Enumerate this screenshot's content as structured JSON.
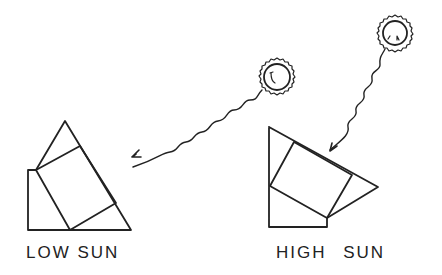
{
  "diagram": {
    "panels": [
      {
        "id": "low",
        "label": "LOW SUN",
        "sun": {
          "cx": 277,
          "cy": 77,
          "r_inner": 13,
          "r_outer": 18
        },
        "ray": {
          "from": [
            262,
            90
          ],
          "to": [
            133,
            157
          ],
          "direction": "shallow diagonal"
        }
      },
      {
        "id": "high",
        "label": "HIGH SUN",
        "sun": {
          "cx": 395,
          "cy": 33,
          "r_inner": 12,
          "r_outer": 17
        },
        "ray": {
          "from": [
            385,
            49
          ],
          "to": [
            330,
            150
          ],
          "direction": "steep"
        }
      }
    ],
    "colors": {
      "stroke": "#222222",
      "background": "#ffffff"
    }
  }
}
